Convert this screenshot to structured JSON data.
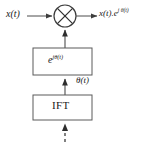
{
  "diagram": {
    "canvas": {
      "width": 147,
      "height": 145,
      "background": "#ffffff"
    },
    "colors": {
      "stroke": "#4d4d4d",
      "text": "#1a1a1a",
      "box_fill": "#ffffff"
    },
    "nodes": {
      "multiplier": {
        "label": "×",
        "shape": "circle-with-cross",
        "cx": 65,
        "cy": 16,
        "r": 11
      },
      "exp_block": {
        "label_base": "e",
        "label_exponent": "jθ(t)",
        "label_full": "e^{jθ(t)}",
        "x": 33,
        "y": 48,
        "width": 59,
        "height": 27
      },
      "ift_block": {
        "label": "IFT",
        "x": 33,
        "y": 95,
        "width": 59,
        "height": 25
      }
    },
    "labels": {
      "input": "x(t)",
      "output_base": "x(t).e",
      "output_exponent": "j θ(t)",
      "output_full": "x(t).e^{j θ(t)}",
      "theta": "θ(t)"
    },
    "edges": [
      {
        "name": "input-to-multiplier",
        "from": "x(t)",
        "to": "multiplier",
        "style": "solid",
        "arrow": true
      },
      {
        "name": "multiplier-to-output",
        "from": "multiplier",
        "to": "output",
        "style": "solid",
        "arrow": true
      },
      {
        "name": "exp-to-multiplier",
        "from": "exp_block",
        "to": "multiplier",
        "style": "solid",
        "arrow": true
      },
      {
        "name": "ift-to-exp",
        "from": "ift_block",
        "to": "exp_block",
        "style": "solid",
        "arrow": true,
        "label": "θ(t)"
      },
      {
        "name": "input-to-ift",
        "from": "source",
        "to": "ift_block",
        "style": "dashed",
        "arrow": true
      }
    ]
  }
}
